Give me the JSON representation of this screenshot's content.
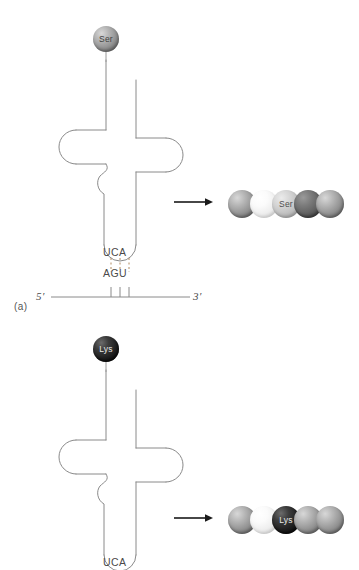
{
  "figure": {
    "type": "biology-diagram",
    "stroke_color": "#8a8a8a",
    "text_color": "#4a4a4a"
  },
  "panels": [
    {
      "id": "a",
      "panel_label": "(a)",
      "trna": {
        "amino_acid": {
          "label": "Ser",
          "sphere_style": "grey",
          "color": "#8e8e8e"
        },
        "anticodon": "UCA",
        "anticodon_loop_name": "anticodon-loop"
      },
      "mrna": {
        "five_prime_label": "5′",
        "three_prime_label": "3′",
        "codon": "AGU",
        "base_pair_count": 3,
        "pairing_style": "dashed-hydrogen-bonds"
      },
      "arrow": {
        "direction": "right",
        "label": ""
      },
      "polypeptide": {
        "residues": [
          {
            "label": "",
            "style": "grey"
          },
          {
            "label": "",
            "style": "white"
          },
          {
            "label": "Ser",
            "style": "light"
          },
          {
            "label": "",
            "style": "dark"
          },
          {
            "label": "",
            "style": "grey"
          }
        ]
      }
    },
    {
      "id": "b",
      "panel_label": "",
      "trna": {
        "amino_acid": {
          "label": "Lys",
          "sphere_style": "black",
          "color": "#121212"
        },
        "anticodon": "UCA",
        "anticodon_loop_name": "anticodon-loop"
      },
      "mrna": null,
      "arrow": {
        "direction": "right",
        "label": ""
      },
      "polypeptide": {
        "residues": [
          {
            "label": "",
            "style": "grey"
          },
          {
            "label": "",
            "style": "white"
          },
          {
            "label": "Lys",
            "style": "black"
          },
          {
            "label": "",
            "style": "grey"
          },
          {
            "label": "",
            "style": "grey"
          }
        ]
      }
    }
  ]
}
